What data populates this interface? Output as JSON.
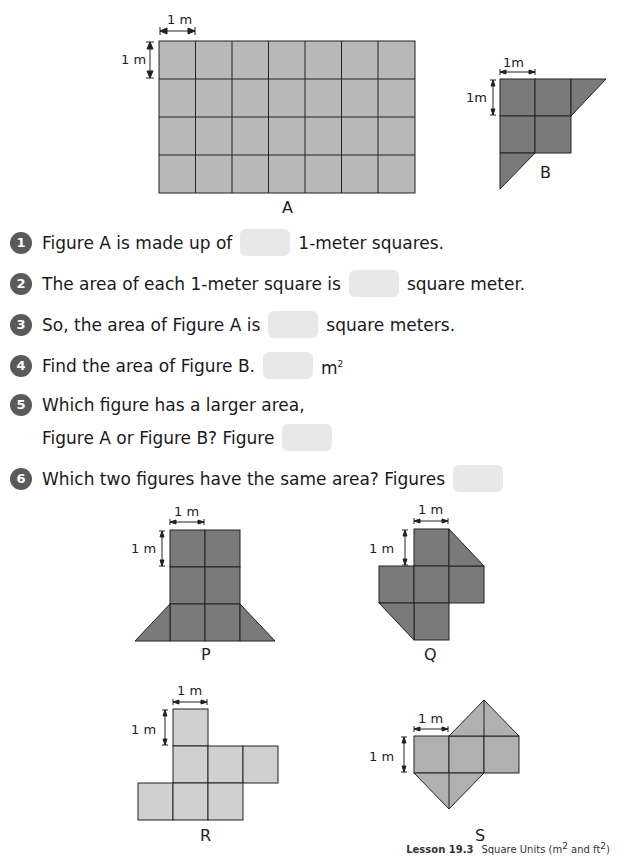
{
  "figures": {
    "A": {
      "label": "A",
      "dim_h": "1 m",
      "dim_v": "1 m",
      "color": "#b8b8b8"
    },
    "B": {
      "label": "B",
      "dim_h": "1m",
      "dim_v": "1m",
      "color": "#7a7a7a"
    },
    "P": {
      "label": "P",
      "dim_h": "1 m",
      "dim_v": "1 m",
      "color": "#7a7a7a"
    },
    "Q": {
      "label": "Q",
      "dim_h": "1 m",
      "dim_v": "1 m",
      "color": "#7a7a7a"
    },
    "R": {
      "label": "R",
      "dim_h": "1 m",
      "dim_v": "1 m",
      "color": "#d0d0d0"
    },
    "S": {
      "label": "S",
      "dim_h": "1 m",
      "dim_v": "1 m",
      "color": "#b0b0b0"
    }
  },
  "questions": [
    {
      "num": "1",
      "before": "Figure A is made up of",
      "after": "1-meter squares."
    },
    {
      "num": "2",
      "before": "The area of each 1-meter square is",
      "after": "square meter."
    },
    {
      "num": "3",
      "before": "So, the area of Figure A is",
      "after": "square meters."
    },
    {
      "num": "4",
      "before": "Find the area of Figure B.",
      "after": "m",
      "after_sup": "2"
    },
    {
      "num": "5",
      "line1": "Which figure has a larger area,",
      "before": "Figure A or Figure B? Figure"
    },
    {
      "num": "6",
      "before": "Which two figures have the same area? Figures"
    }
  ],
  "footer": {
    "lesson": "Lesson 19.3",
    "title_pre": "Square Units (m",
    "sup1": "2",
    "mid": " and ft",
    "sup2": "2",
    "title_post": ")"
  }
}
